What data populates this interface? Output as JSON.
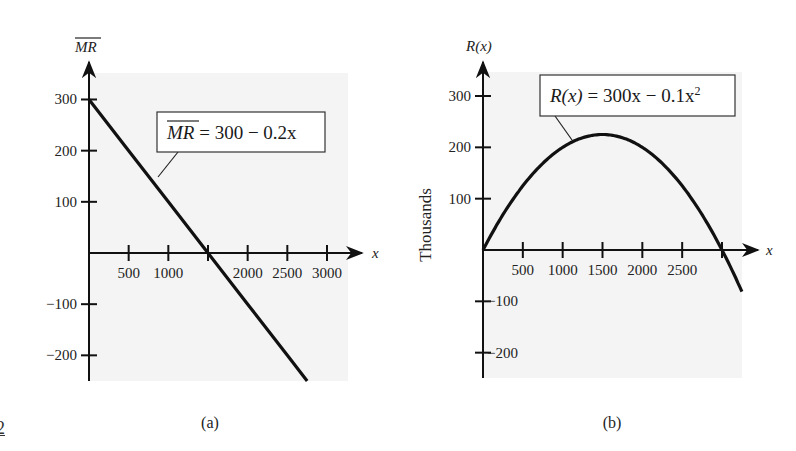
{
  "page_number_fragment": "2",
  "chart_data": [
    {
      "type": "line",
      "panel_caption": "(a)",
      "title": "",
      "equation_label": {
        "lhs": "MR",
        "lhs_overline": true,
        "rhs": " = 300 − 0.2x"
      },
      "xlabel": "x",
      "ylabel": "MR (overlined)",
      "x_ticks": [
        500,
        1000,
        1500,
        2000,
        2500,
        3000
      ],
      "x_tick_labels": [
        "500",
        "1000",
        "",
        "2000",
        "2500",
        "3000"
      ],
      "y_ticks": [
        300,
        200,
        100,
        -100,
        -200
      ],
      "y_tick_labels": [
        "300",
        "200",
        "100",
        "−100",
        "−200"
      ],
      "xlim": [
        0,
        3250
      ],
      "ylim": [
        -250,
        360
      ],
      "grid": false,
      "series": [
        {
          "name": "MR = 300 − 0.2x",
          "x": [
            0,
            500,
            1000,
            1500,
            2000,
            2500,
            2750
          ],
          "y": [
            300,
            200,
            100,
            0,
            -100,
            -200,
            -250
          ]
        }
      ]
    },
    {
      "type": "line",
      "panel_caption": "(b)",
      "title": "",
      "equation_label": {
        "lhs": "R(x)",
        "rhs": " = 300x − 0.1x",
        "superscript": "2"
      },
      "xlabel": "x",
      "ylabel": "R(x)",
      "y_side_label": "Thousands",
      "x_ticks": [
        500,
        1000,
        1500,
        2000,
        2500,
        3000
      ],
      "x_tick_labels": [
        "500",
        "1000",
        "1500",
        "2000",
        "2500",
        ""
      ],
      "y_ticks": [
        300,
        200,
        100,
        -100,
        -200
      ],
      "y_tick_labels": [
        "300",
        "200",
        "100",
        "−100",
        "−200"
      ],
      "xlim": [
        0,
        3300
      ],
      "ylim": [
        -250,
        360
      ],
      "grid": false,
      "series": [
        {
          "name": "R(x) = 300x − 0.1x²",
          "x": [
            0,
            250,
            500,
            750,
            1000,
            1250,
            1500,
            1750,
            2000,
            2250,
            2500,
            2750,
            3000,
            3250
          ],
          "y": [
            0,
            68.75,
            125,
            168.75,
            200,
            218.75,
            225,
            218.75,
            200,
            168.75,
            125,
            68.75,
            0,
            -81.25
          ]
        }
      ]
    }
  ],
  "colors": {
    "panel_bg": "#f4f4f4",
    "ink": "#111111",
    "page_bg": "#ffffff"
  }
}
